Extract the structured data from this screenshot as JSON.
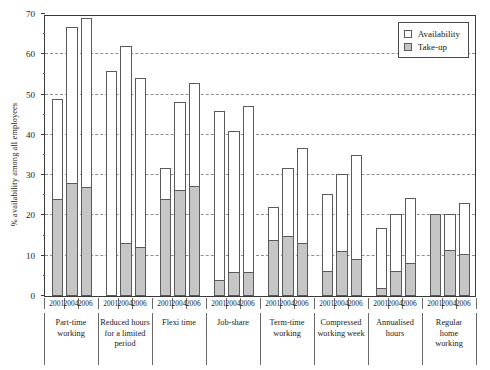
{
  "chart_data": {
    "type": "bar",
    "title": "",
    "subtitle": "",
    "xlabel": "",
    "ylabel": "% availability among all employees",
    "ylim": [
      0,
      70
    ],
    "yticks": [
      0,
      10,
      20,
      30,
      40,
      50,
      60,
      70
    ],
    "ytick_labels": [
      "0",
      "10",
      "20",
      "30",
      "40",
      "50",
      "60",
      "70"
    ],
    "grid": "horizontal-dashed",
    "legend_position": "top-right",
    "stacking": "overlay",
    "categories": [
      "Part-time working",
      "Reduced hours for a limited period",
      "Flexi time",
      "Job-share",
      "Term-time working",
      "Compressed working week",
      "Annualised hours",
      "Regular home working"
    ],
    "subcategories": [
      "2001",
      "2004",
      "2006"
    ],
    "series": [
      {
        "name": "Availability",
        "color": "#ffffff",
        "values": [
          [
            49.0,
            66.7,
            69.0
          ],
          [
            55.8,
            62.0,
            54.0
          ],
          [
            31.7,
            48.2,
            53.0
          ],
          [
            46.0,
            41.0,
            47.2
          ],
          [
            22.0,
            31.8,
            36.8
          ],
          [
            25.3,
            30.3,
            35.0
          ],
          [
            17.0,
            20.3,
            24.3
          ],
          [
            20.3,
            20.3,
            23.2
          ]
        ]
      },
      {
        "name": "Take-up",
        "color": "#c6c6c6",
        "values": [
          [
            24.0,
            28.0,
            27.0
          ],
          [
            0.0,
            13.2,
            12.2
          ],
          [
            24.0,
            26.2,
            27.2
          ],
          [
            4.0,
            6.0,
            6.0
          ],
          [
            14.0,
            15.0,
            13.2
          ],
          [
            6.2,
            11.2,
            9.2
          ],
          [
            2.0,
            6.1,
            8.3
          ],
          [
            20.3,
            11.3,
            10.5
          ]
        ]
      }
    ]
  },
  "legend": {
    "items": [
      {
        "label": "Availability",
        "swatch": "availability-swatch"
      },
      {
        "label": "Take-up",
        "swatch": "takeup-swatch"
      }
    ]
  },
  "axis": {
    "y_title": "% availability among all employees"
  },
  "group_labels": [
    "Part-time\nworking",
    "Reduced hours\nfor a limited\nperiod",
    "Flexi time",
    "Job-share",
    "Term-time\nworking",
    "Compressed\nworking week",
    "Annualised\nhours",
    "Regular\nhome\nworking"
  ]
}
